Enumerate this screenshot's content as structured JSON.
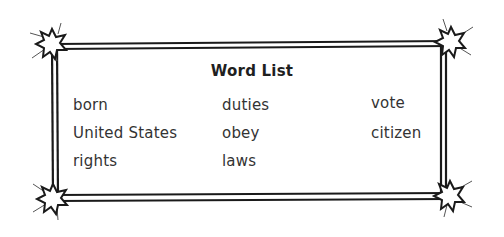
{
  "word_list": {
    "title": "Word List",
    "columns": [
      {
        "words": [
          "born",
          "United States",
          "rights"
        ]
      },
      {
        "words": [
          "duties",
          "obey",
          "laws"
        ]
      },
      {
        "words": [
          "vote",
          "citizen"
        ]
      }
    ]
  },
  "frame": {
    "style": "double-line border with starburst corners",
    "line_color": "#1a1a1a",
    "star_fill": "#ffffff",
    "star_stroke": "#1a1a1a"
  }
}
